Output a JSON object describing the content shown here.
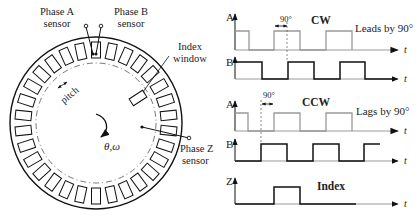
{
  "disk": {
    "labels": {
      "phase_a_line1": "Phase A",
      "phase_a_line2": "sensor",
      "phase_b_line1": "Phase B",
      "phase_b_line2": "sensor",
      "index_line1": "Index",
      "index_line2": "window",
      "pitch": "pitch",
      "rotation": "θ,ω",
      "phase_z_line1": "Phase Z",
      "phase_z_line2": "sensor"
    },
    "slot_count": 30,
    "colors": {
      "stroke": "#111111",
      "dashed": "#555555"
    }
  },
  "timing": {
    "cw": {
      "title": "CW",
      "note": "Leads by 90°",
      "angle_label": "90°",
      "signal_a": "A",
      "signal_b": "B",
      "axis": "t"
    },
    "ccw": {
      "title": "CCW",
      "note": "Lags by 90°",
      "angle_label": "90°",
      "signal_a": "A",
      "signal_b": "B",
      "axis": "t"
    },
    "index": {
      "title": "Index",
      "signal_z": "Z",
      "axis": "t"
    },
    "colors": {
      "signal_a": "#999999",
      "signal_b": "#111111",
      "signal_z": "#111111"
    }
  },
  "chart_data": {
    "type": "line",
    "xlabel": "t",
    "series": [
      {
        "name": "CW A",
        "step_edges_x": [
          0,
          14,
          39,
          65,
          91,
          117
        ],
        "levels": [
          1,
          0,
          1,
          0,
          1,
          0
        ]
      },
      {
        "name": "CW B",
        "step_edges_x": [
          0,
          27,
          53,
          79,
          105,
          130
        ],
        "levels": [
          1,
          0,
          1,
          0,
          1,
          0
        ]
      },
      {
        "name": "CCW A",
        "step_edges_x": [
          0,
          13,
          39,
          65,
          91,
          117
        ],
        "levels": [
          1,
          0,
          1,
          0,
          1,
          0
        ]
      },
      {
        "name": "CCW B",
        "step_edges_x": [
          0,
          26,
          52,
          78,
          104,
          129
        ],
        "levels": [
          0,
          1,
          0,
          1,
          0,
          1
        ]
      },
      {
        "name": "Index Z",
        "step_edges_x": [
          0,
          39,
          65
        ],
        "levels": [
          0,
          1,
          0
        ]
      }
    ],
    "annotations": [
      "CW: Leads by 90°",
      "CCW: Lags by 90°",
      "90° phase offset"
    ]
  }
}
